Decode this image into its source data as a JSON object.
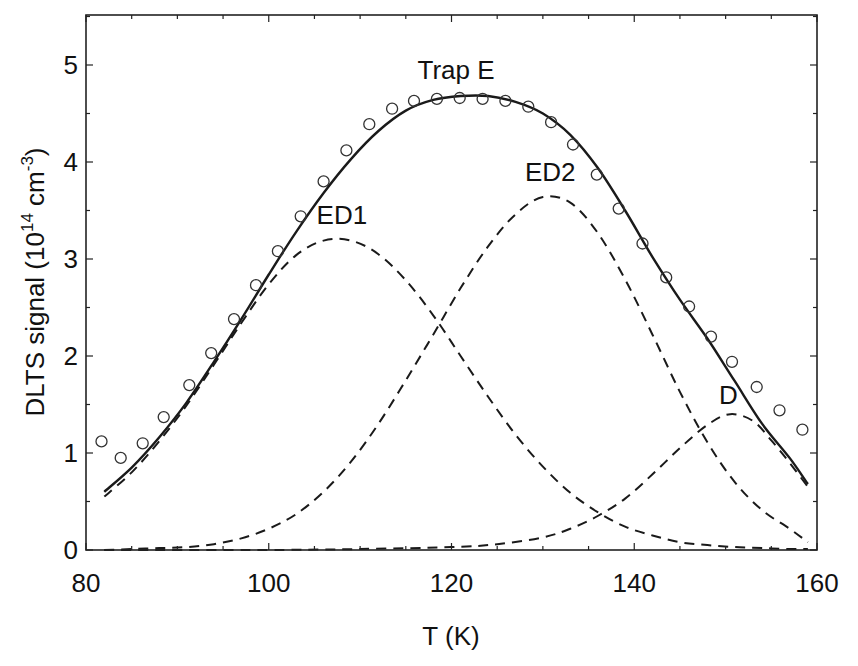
{
  "chart_data": {
    "type": "scatter",
    "title": "",
    "xlabel": "T (K)",
    "ylabel": "DLTS signal (10^14 cm^-3)",
    "ylabel_parts": {
      "main": "DLTS signal (10",
      "exp1": "14",
      "mid": " cm",
      "exp2": "-3",
      "end": ")"
    },
    "xlim": [
      80,
      160
    ],
    "ylim": [
      0,
      5.5
    ],
    "xticks": [
      80,
      100,
      120,
      140,
      160
    ],
    "yticks": [
      0,
      1,
      2,
      3,
      4,
      5
    ],
    "x_minor_step": 5,
    "y_minor_step": 0.5,
    "grid": false,
    "legend": null,
    "annotations": [
      {
        "text": "Trap E",
        "x": 120.5,
        "y": 4.95
      },
      {
        "text": "ED1",
        "x": 108.0,
        "y": 3.45
      },
      {
        "text": "ED2",
        "x": 130.8,
        "y": 3.9
      },
      {
        "text": "D",
        "x": 150.3,
        "y": 1.6
      }
    ],
    "series": [
      {
        "name": "Measured (Trap E)",
        "style": "open-circle",
        "x": [
          81.7,
          83.8,
          86.2,
          88.5,
          91.3,
          93.7,
          96.2,
          98.6,
          101.0,
          103.5,
          106.0,
          108.5,
          111.0,
          113.5,
          115.9,
          118.4,
          120.9,
          123.4,
          125.9,
          128.4,
          130.9,
          133.3,
          135.9,
          138.3,
          140.9,
          143.5,
          146.0,
          148.4,
          150.7,
          153.4,
          155.9,
          158.4
        ],
        "y": [
          1.12,
          0.95,
          1.1,
          1.37,
          1.7,
          2.03,
          2.38,
          2.73,
          3.08,
          3.44,
          3.8,
          4.12,
          4.39,
          4.55,
          4.63,
          4.65,
          4.66,
          4.65,
          4.63,
          4.57,
          4.41,
          4.18,
          3.87,
          3.52,
          3.16,
          2.81,
          2.51,
          2.2,
          1.94,
          1.68,
          1.44,
          1.24
        ]
      },
      {
        "name": "Fit (sum)",
        "style": "solid",
        "x": [
          82,
          85,
          88,
          91,
          94,
          97,
          100,
          103,
          106,
          109,
          112,
          115,
          118,
          121,
          124,
          127,
          130,
          133,
          136,
          139,
          142,
          145,
          148,
          151,
          154,
          157,
          159
        ],
        "y": [
          0.6,
          0.85,
          1.16,
          1.52,
          1.94,
          2.38,
          2.84,
          3.28,
          3.68,
          4.03,
          4.32,
          4.53,
          4.64,
          4.68,
          4.68,
          4.62,
          4.5,
          4.28,
          3.94,
          3.5,
          3.02,
          2.58,
          2.18,
          1.74,
          1.3,
          0.95,
          0.68
        ]
      },
      {
        "name": "ED1",
        "style": "dashed",
        "x": [
          82,
          85,
          88,
          91,
          94,
          97,
          100,
          103,
          106,
          109,
          112,
          115,
          118,
          121,
          124,
          127,
          130,
          133,
          136,
          139,
          142,
          145,
          148,
          151,
          154,
          157,
          159
        ],
        "y": [
          0.55,
          0.8,
          1.12,
          1.49,
          1.91,
          2.34,
          2.74,
          3.04,
          3.19,
          3.19,
          3.05,
          2.78,
          2.42,
          2.0,
          1.58,
          1.19,
          0.86,
          0.59,
          0.39,
          0.24,
          0.15,
          0.08,
          0.05,
          0.03,
          0.02,
          0.01,
          0.01
        ]
      },
      {
        "name": "ED2",
        "style": "dashed",
        "x": [
          82,
          85,
          88,
          91,
          94,
          97,
          100,
          103,
          106,
          109,
          112,
          115,
          118,
          121,
          124,
          127,
          130,
          133,
          136,
          139,
          142,
          145,
          148,
          151,
          154,
          157,
          159
        ],
        "y": [
          0.0,
          0.01,
          0.02,
          0.03,
          0.06,
          0.12,
          0.22,
          0.37,
          0.6,
          0.91,
          1.3,
          1.75,
          2.22,
          2.7,
          3.13,
          3.46,
          3.64,
          3.58,
          3.27,
          2.79,
          2.22,
          1.63,
          1.11,
          0.7,
          0.41,
          0.22,
          0.08
        ]
      },
      {
        "name": "D",
        "style": "dashed",
        "x": [
          82,
          100,
          110,
          120,
          125,
          130,
          133,
          136,
          139,
          142,
          145,
          148,
          150.5,
          153,
          155,
          157,
          159
        ],
        "y": [
          0.0,
          0.0,
          0.01,
          0.03,
          0.06,
          0.13,
          0.22,
          0.35,
          0.53,
          0.78,
          1.05,
          1.29,
          1.4,
          1.33,
          1.13,
          0.9,
          0.65
        ]
      }
    ]
  }
}
